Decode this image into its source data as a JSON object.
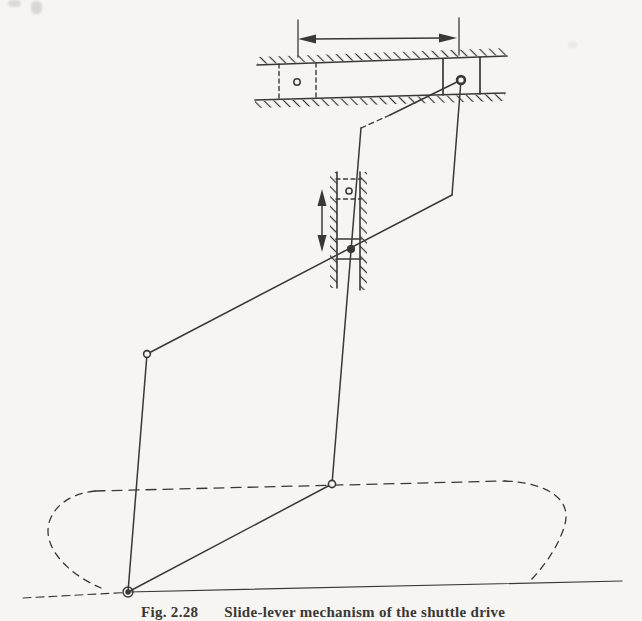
{
  "page": {
    "kind": "scanned-book-figure",
    "paper_color": "#f6f5f2",
    "ink_color": "#3a3835"
  },
  "figure": {
    "caption_label": "Fig. 2.28",
    "caption_text": "Slide-lever mechanism of the shuttle drive"
  },
  "diagram": {
    "type": "kinematic-linkage",
    "components": [
      "horizontal-guide-with-hatching",
      "horizontal-slider-solid-position",
      "horizontal-slider-dashed-previous-position",
      "horizontal-stroke-double-arrow",
      "vertical-guide-with-hatching",
      "vertical-slider-solid-position",
      "vertical-slider-dashed-previous-position",
      "vertical-stroke-double-arrow",
      "bent-link-upper-left",
      "bent-link-upper-right",
      "lower-link-left",
      "lower-link-right",
      "revolute-pin-joints",
      "fixed-ground-pivot",
      "dashed-capsule-path",
      "ground-line"
    ]
  }
}
